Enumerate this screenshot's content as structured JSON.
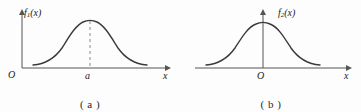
{
  "figure": {
    "background_color": "#fdfdfd",
    "curve_color": "#3a3a3a",
    "axis_color": "#555555",
    "dash_color": "#8a8a8a"
  },
  "panels": [
    {
      "id": "a",
      "caption": "( a )",
      "y_axis_label": "f",
      "y_axis_label_sub": "1",
      "y_axis_label_arg": "(x)",
      "x_axis_label": "x",
      "origin_label": "O",
      "mean_tick_label": "a",
      "has_dashed_peak_line": true,
      "curve": {
        "type": "normal-density",
        "peak_x": 90,
        "peak_y": 21,
        "baseline_y": 68,
        "left_end_x": 33,
        "right_end_x": 147
      }
    },
    {
      "id": "b",
      "caption": "( b )",
      "y_axis_label": "f",
      "y_axis_label_sub": "2",
      "y_axis_label_arg": "(x)",
      "x_axis_label": "x",
      "origin_label": "O",
      "mean_tick_label": "",
      "has_dashed_peak_line": false,
      "curve": {
        "type": "normal-density",
        "peak_x": 82,
        "peak_y": 23,
        "baseline_y": 68,
        "left_end_x": 25,
        "right_end_x": 139
      }
    }
  ]
}
